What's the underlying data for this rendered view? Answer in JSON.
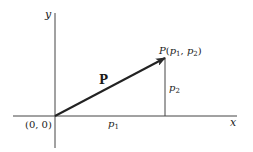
{
  "diagram": {
    "title": "",
    "colors": {
      "line": "#2a2a2a",
      "text": "#1a1a1a",
      "background": "#ffffff"
    },
    "axes": {
      "x_label": "x",
      "y_label": "y",
      "origin_label": "(0, 0)"
    },
    "vector": {
      "name": "P",
      "from": [
        0,
        0
      ],
      "to": [
        "p1",
        "p2"
      ]
    },
    "point": {
      "name": "P",
      "open": "(",
      "c1_base": "p",
      "c1_sub": "1",
      "sep": ", ",
      "c2_base": "p",
      "c2_sub": "2",
      "close": ")"
    },
    "components": {
      "p1_base": "p",
      "p1_sub": "1",
      "p2_base": "p",
      "p2_sub": "2"
    }
  }
}
